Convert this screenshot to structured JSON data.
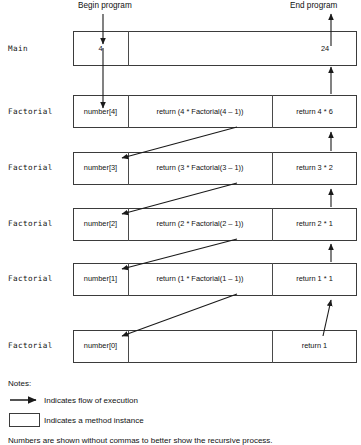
{
  "diagram": {
    "title_begin": "Begin program",
    "title_end": "End program",
    "entry_value": "4",
    "exit_value": "24",
    "rows": [
      {
        "label": "Main",
        "cell_param": "4",
        "cell_body": "",
        "cell_return": "24",
        "kind": "main"
      },
      {
        "label": "Factorial",
        "cell_param": "number[4]",
        "cell_body": "return (4 * Factorial(4 – 1))",
        "cell_return": "return 4 * 6",
        "kind": "factorial"
      },
      {
        "label": "Factorial",
        "cell_param": "number[3]",
        "cell_body": "return (3 * Factorial(3 – 1))",
        "cell_return": "return 3 * 2",
        "kind": "factorial"
      },
      {
        "label": "Factorial",
        "cell_param": "number[2]",
        "cell_body": "return (2 * Factorial(2 – 1))",
        "cell_return": "return 2 * 1",
        "kind": "factorial"
      },
      {
        "label": "Factorial",
        "cell_param": "number[1]",
        "cell_body": "return (1 * Factorial(1 – 1))",
        "cell_return": "return 1 * 1",
        "kind": "factorial"
      },
      {
        "label": "Factorial",
        "cell_param": "number[0]",
        "cell_body": "",
        "cell_return": "return 1",
        "kind": "factorial"
      }
    ]
  },
  "notes": {
    "heading": "Notes:",
    "items": [
      {
        "icon": "arrow-glyph",
        "text": "Indicates flow of execution"
      },
      {
        "icon": "box-glyph",
        "text": "Indicates a method instance"
      }
    ],
    "footnote": "Numbers are shown without commas to better show the recursive process."
  },
  "colors": {
    "stroke": "#3b3b3b",
    "divider": "#4a4a4a",
    "arrow": "#1a1a1a",
    "text": "#111111",
    "background": "#ffffff"
  }
}
